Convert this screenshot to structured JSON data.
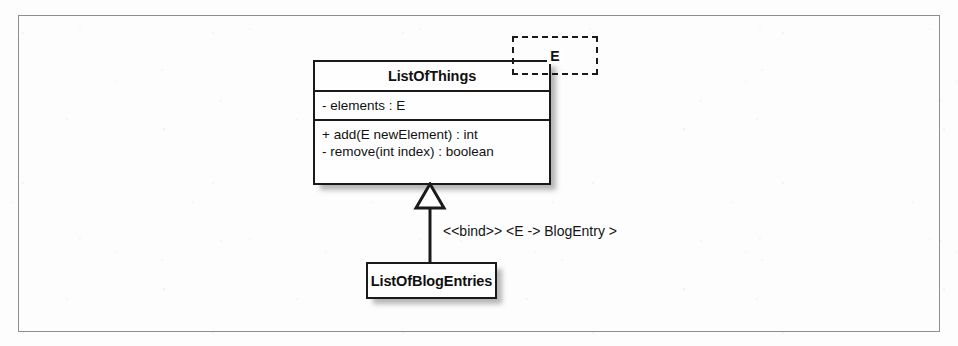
{
  "diagram": {
    "type": "uml-class-diagram",
    "frame": {
      "label": ""
    },
    "generic_class": {
      "name": "ListOfThings",
      "template_parameter": "E",
      "attributes": [
        "- elements : E"
      ],
      "operations": [
        "+ add(E newElement) : int",
        "- remove(int index) : boolean"
      ]
    },
    "relationship": {
      "kind": "generalization-binding",
      "stereotype_label": "<<bind>> <E -> BlogEntry >",
      "arrow_head": "hollow-triangle"
    },
    "bound_class": {
      "name": "ListOfBlogEntries"
    },
    "colors": {
      "line": "#1a1a1a",
      "frame": "#8e8e8e",
      "box_fill": "#fefefe",
      "shadow": "rgba(80,80,80,0.42)",
      "text": "#101010",
      "background": "#fdfdfd"
    }
  }
}
